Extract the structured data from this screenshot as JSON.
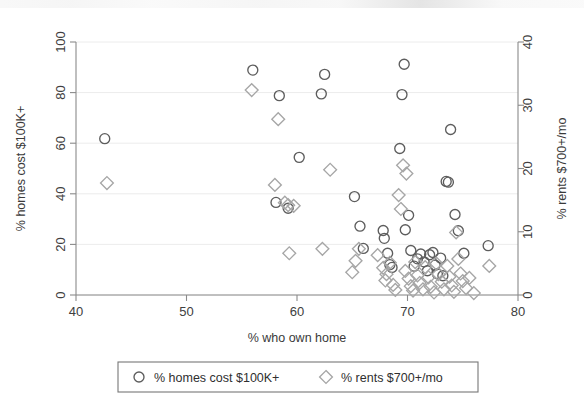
{
  "chart_data": {
    "type": "scatter",
    "title": "",
    "xlabel": "% who own home",
    "ylabel": "% homes cost $100K+",
    "y2label": "% rents $700+/mo",
    "xlim": [
      40,
      80
    ],
    "ylim": [
      0,
      100
    ],
    "y2lim": [
      0,
      40
    ],
    "xticks": [
      40,
      50,
      60,
      70,
      80
    ],
    "yticks": [
      0,
      20,
      40,
      60,
      80,
      100
    ],
    "y2ticks": [
      0,
      10,
      20,
      30,
      40
    ],
    "grid": true,
    "legend_position": "below-axis",
    "series": [
      {
        "name": "% homes cost $100K+",
        "marker": "circle",
        "color": "#5d5d5d",
        "axis": "left",
        "points": [
          [
            42.6,
            61.8
          ],
          [
            56.0,
            88.9
          ],
          [
            58.4,
            78.8
          ],
          [
            58.1,
            36.6
          ],
          [
            59.2,
            34.3
          ],
          [
            60.2,
            54.4
          ],
          [
            62.2,
            79.5
          ],
          [
            62.5,
            87.2
          ],
          [
            65.2,
            38.9
          ],
          [
            65.7,
            27.2
          ],
          [
            66.0,
            18.4
          ],
          [
            67.8,
            25.5
          ],
          [
            67.9,
            22.4
          ],
          [
            68.2,
            16.5
          ],
          [
            68.4,
            12.0
          ],
          [
            68.6,
            10.9
          ],
          [
            69.3,
            57.9
          ],
          [
            69.5,
            79.2
          ],
          [
            69.7,
            91.2
          ],
          [
            69.8,
            25.8
          ],
          [
            70.1,
            31.5
          ],
          [
            70.3,
            17.6
          ],
          [
            70.6,
            11.4
          ],
          [
            70.9,
            14.3
          ],
          [
            71.2,
            16.2
          ],
          [
            71.5,
            13.1
          ],
          [
            71.8,
            9.6
          ],
          [
            72.0,
            15.9
          ],
          [
            72.3,
            16.8
          ],
          [
            72.5,
            11.8
          ],
          [
            72.7,
            8.4
          ],
          [
            73.0,
            14.6
          ],
          [
            73.2,
            7.6
          ],
          [
            73.5,
            44.9
          ],
          [
            73.7,
            44.6
          ],
          [
            73.9,
            65.4
          ],
          [
            74.3,
            31.8
          ],
          [
            74.6,
            25.4
          ],
          [
            75.1,
            16.5
          ],
          [
            77.3,
            19.5
          ]
        ]
      },
      {
        "name": "% rents $700+/mo",
        "marker": "diamond",
        "color": "#a6a6a6",
        "axis": "right",
        "points": [
          [
            42.8,
            17.7
          ],
          [
            55.9,
            32.4
          ],
          [
            58.3,
            27.8
          ],
          [
            58.0,
            17.4
          ],
          [
            58.9,
            14.6
          ],
          [
            59.2,
            14.2
          ],
          [
            59.7,
            14.1
          ],
          [
            59.3,
            6.6
          ],
          [
            62.3,
            7.3
          ],
          [
            63.0,
            19.8
          ],
          [
            65.0,
            3.6
          ],
          [
            65.3,
            5.4
          ],
          [
            65.6,
            7.3
          ],
          [
            67.3,
            6.3
          ],
          [
            67.8,
            4.3
          ],
          [
            68.1,
            3.3
          ],
          [
            68.0,
            2.3
          ],
          [
            68.4,
            5.1
          ],
          [
            68.7,
            1.6
          ],
          [
            68.9,
            0.8
          ],
          [
            69.2,
            15.8
          ],
          [
            69.4,
            13.6
          ],
          [
            69.6,
            20.5
          ],
          [
            69.9,
            19.2
          ],
          [
            69.8,
            3.8
          ],
          [
            70.1,
            2.6
          ],
          [
            70.3,
            1.4
          ],
          [
            70.5,
            0.7
          ],
          [
            70.7,
            5.2
          ],
          [
            70.9,
            3.1
          ],
          [
            71.1,
            1.9
          ],
          [
            71.4,
            0.9
          ],
          [
            71.6,
            4.4
          ],
          [
            71.9,
            2.8
          ],
          [
            72.1,
            1.3
          ],
          [
            72.4,
            0.4
          ],
          [
            72.6,
            5.0
          ],
          [
            72.8,
            3.3
          ],
          [
            73.1,
            2.1
          ],
          [
            73.3,
            0.9
          ],
          [
            73.6,
            4.6
          ],
          [
            73.8,
            2.9
          ],
          [
            74.0,
            1.5
          ],
          [
            74.2,
            0.5
          ],
          [
            74.4,
            9.9
          ],
          [
            74.6,
            5.7
          ],
          [
            74.8,
            3.4
          ],
          [
            75.0,
            2.2
          ],
          [
            75.3,
            1.1
          ],
          [
            75.6,
            2.7
          ],
          [
            76.0,
            0.3
          ],
          [
            77.4,
            4.6
          ]
        ]
      }
    ]
  },
  "legend": {
    "items": [
      {
        "label": "% homes cost $100K+",
        "marker": "circle"
      },
      {
        "label": "% rents $700+/mo",
        "marker": "diamond"
      }
    ]
  }
}
